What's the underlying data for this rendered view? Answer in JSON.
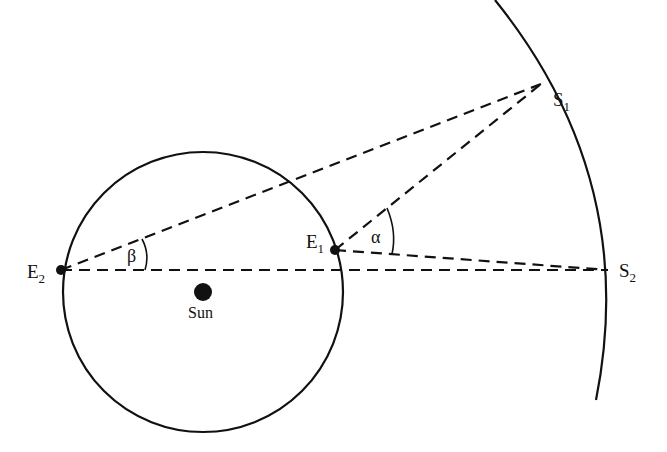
{
  "diagram": {
    "colors": {
      "stroke": "#111111",
      "background": "#ffffff"
    },
    "points": {
      "E1": {
        "label": "E",
        "subscript": "1",
        "x": 335,
        "y": 250
      },
      "E2": {
        "label": "E",
        "subscript": "2",
        "x": 61,
        "y": 270
      },
      "S1": {
        "label": "S",
        "subscript": "1",
        "x": 541,
        "y": 84
      },
      "S2": {
        "label": "S",
        "subscript": "2",
        "x": 608,
        "y": 270
      },
      "Sun": {
        "label": "Sun",
        "x": 203,
        "y": 292
      }
    },
    "orbit": {
      "cx": 203,
      "cy": 292,
      "r": 140
    },
    "angles": {
      "alpha": {
        "label": "α",
        "vertex": "E1",
        "between": [
          "S1",
          "S2"
        ]
      },
      "beta": {
        "label": "β",
        "vertex": "E2",
        "between": [
          "S1",
          "S2"
        ]
      }
    },
    "lines": [
      {
        "from": "E2",
        "to": "S1",
        "style": "dashed"
      },
      {
        "from": "E2",
        "to": "S2",
        "style": "dashed"
      },
      {
        "from": "E1",
        "to": "S1",
        "style": "dashed"
      },
      {
        "from": "E1",
        "to": "S2",
        "style": "dashed"
      }
    ]
  }
}
